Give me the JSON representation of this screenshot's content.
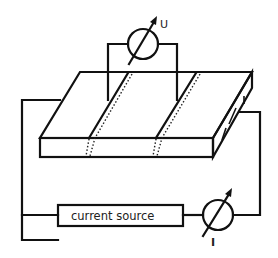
{
  "diagram": {
    "voltmeter": {
      "label": "U",
      "symbol": "meter-with-arrow"
    },
    "ammeter": {
      "label": "I",
      "symbol": "meter-with-arrow"
    },
    "current_source": {
      "label": "current source"
    },
    "sample": {
      "description": "rectangular slab with two diagonal stripes"
    },
    "colors": {
      "line": "#111111",
      "background": "#ffffff"
    }
  }
}
